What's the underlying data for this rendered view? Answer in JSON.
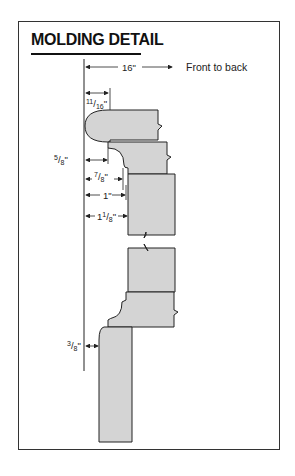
{
  "title": "MOLDING DETAIL",
  "top_dimension": {
    "value": "16\"",
    "label": "Front to back"
  },
  "dimensions": [
    {
      "id": "d1",
      "text": "11/16\""
    },
    {
      "id": "d2",
      "text": "5/8\""
    },
    {
      "id": "d3",
      "text": "7/8\""
    },
    {
      "id": "d4",
      "text": "1\""
    },
    {
      "id": "d5",
      "text": "11/8\""
    },
    {
      "id": "d6",
      "text": "3/8\""
    }
  ],
  "colors": {
    "fill": "#d4d4d4",
    "stroke": "#222222",
    "frame": "#333333"
  }
}
